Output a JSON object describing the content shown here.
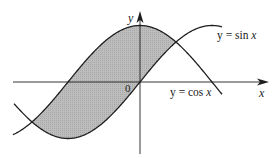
{
  "figure": {
    "axes": {
      "x_label": "x",
      "y_label": "y",
      "origin_label": "0"
    },
    "curves": [
      {
        "name": "sin",
        "label_prefix": "y = sin ",
        "label_var": "x"
      },
      {
        "name": "cos",
        "label_prefix": "y = cos ",
        "label_var": "x"
      }
    ],
    "shaded_region": {
      "from": "-3π/4",
      "to": "π/4",
      "upper": "cos x",
      "lower": "sin x"
    },
    "colors": {
      "line": "#1e1e1e",
      "fill": "#b6b6b6",
      "background": "#ffffff"
    },
    "geometry": {
      "origin_px": [
        140,
        82
      ],
      "half_pi_px": 72,
      "amplitude_px": 56.5,
      "x_range_px": [
        13,
        222
      ]
    }
  }
}
